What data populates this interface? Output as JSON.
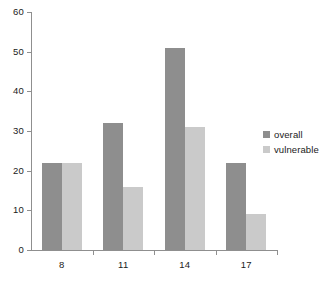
{
  "chart_data": {
    "type": "bar",
    "title": "",
    "subtitle": "",
    "xlabel": "",
    "ylabel": "",
    "categories": [
      "8",
      "11",
      "14",
      "17"
    ],
    "series": [
      {
        "name": "overall",
        "color": "#8e8e8e",
        "values": [
          22,
          32,
          51,
          22
        ]
      },
      {
        "name": "vulnerable",
        "color": "#cacaca",
        "values": [
          22,
          16,
          31,
          9
        ]
      }
    ],
    "ylim": [
      0,
      60
    ],
    "ytick_labels": [
      "0",
      "10",
      "20",
      "30",
      "40",
      "50",
      "60"
    ],
    "ytick_values": [
      0,
      10,
      20,
      30,
      40,
      50,
      60
    ],
    "grid": false,
    "legend_position": "right",
    "legend_entries": [
      "overall",
      "vulnerable"
    ],
    "annotations": []
  },
  "axes": {
    "y": {
      "labels": [
        "60",
        "50",
        "40",
        "30",
        "20",
        "10",
        "0"
      ]
    },
    "x": {
      "labels": [
        "8",
        "11",
        "14",
        "17"
      ]
    }
  },
  "legend": {
    "items": [
      {
        "label": "overall",
        "swatch": "overall-swatch-icon"
      },
      {
        "label": "vulnerable",
        "swatch": "vulnerable-swatch-icon"
      }
    ]
  },
  "colors": {
    "overall": "#8e8e8e",
    "vulnerable": "#cacaca",
    "axis": "#8f8f8f",
    "text": "#1a1a1a",
    "background": "#ffffff"
  }
}
